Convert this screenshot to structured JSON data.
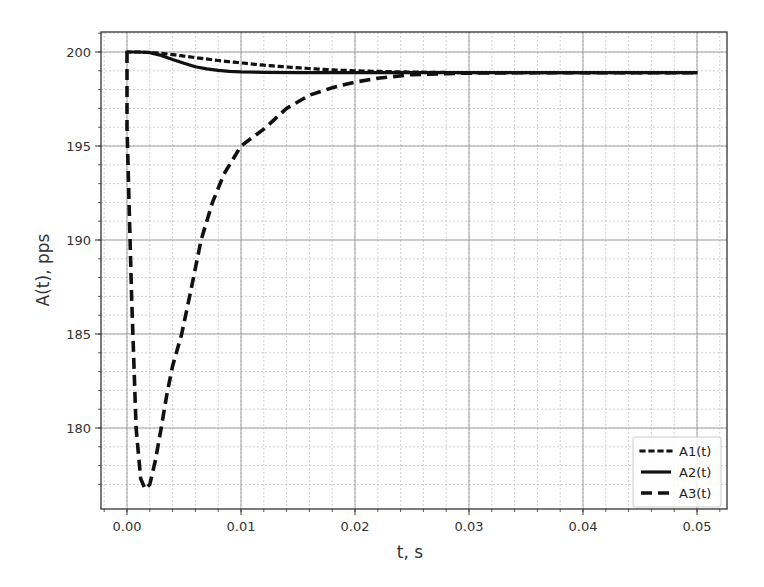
{
  "chart_data": {
    "type": "line",
    "title": "",
    "xlabel": "t, s",
    "ylabel": "A(t), pps",
    "xlim": [
      -0.0022,
      0.0528
    ],
    "ylim": [
      176.1,
      201.1
    ],
    "xticks": [
      0.0,
      0.01,
      0.02,
      0.03,
      0.04,
      0.05
    ],
    "xtick_labels": [
      "0.00",
      "0.01",
      "0.02",
      "0.03",
      "0.04",
      "0.05"
    ],
    "yticks": [
      180,
      185,
      190,
      195,
      200
    ],
    "ytick_labels": [
      "180",
      "185",
      "190",
      "195",
      "200"
    ],
    "x_minor_step": 0.002,
    "y_minor_step": 1,
    "grid": true,
    "grid_minor": true,
    "legend_position": "lower right",
    "series": [
      {
        "name": "A1(t)",
        "style": "dotted",
        "x": [
          0.0,
          0.001,
          0.002,
          0.003,
          0.004,
          0.005,
          0.006,
          0.008,
          0.01,
          0.012,
          0.014,
          0.016,
          0.018,
          0.02,
          0.022,
          0.025,
          0.03,
          0.035,
          0.04,
          0.045,
          0.05
        ],
        "y": [
          200.0,
          200.0,
          199.98,
          199.93,
          199.86,
          199.78,
          199.7,
          199.55,
          199.42,
          199.3,
          199.2,
          199.12,
          199.05,
          199.0,
          198.97,
          198.93,
          198.9,
          198.9,
          198.9,
          198.9,
          198.9
        ]
      },
      {
        "name": "A2(t)",
        "style": "solid",
        "x": [
          0.0,
          0.001,
          0.002,
          0.003,
          0.004,
          0.005,
          0.006,
          0.007,
          0.008,
          0.009,
          0.01,
          0.012,
          0.015,
          0.02,
          0.03,
          0.04,
          0.05
        ],
        "y": [
          200.0,
          200.0,
          199.97,
          199.82,
          199.6,
          199.4,
          199.22,
          199.1,
          199.02,
          198.97,
          198.94,
          198.92,
          198.9,
          198.9,
          198.9,
          198.9,
          198.9
        ]
      },
      {
        "name": "A3(t)",
        "style": "dashed",
        "x": [
          0.0,
          0.0,
          0.0004,
          0.0008,
          0.0012,
          0.0016,
          0.002,
          0.0025,
          0.003,
          0.0035,
          0.004,
          0.0048,
          0.0056,
          0.0065,
          0.0075,
          0.0085,
          0.01,
          0.012,
          0.014,
          0.016,
          0.018,
          0.02,
          0.022,
          0.025,
          0.028,
          0.03,
          0.035,
          0.04,
          0.045,
          0.05
        ],
        "y": [
          200.0,
          196.0,
          187.0,
          180.0,
          177.3,
          176.75,
          177.0,
          178.3,
          180.0,
          181.8,
          183.3,
          185.0,
          187.3,
          190.0,
          192.0,
          193.5,
          195.0,
          195.9,
          197.0,
          197.7,
          198.1,
          198.4,
          198.6,
          198.8,
          198.85,
          198.88,
          198.9,
          198.9,
          198.9,
          198.9
        ]
      }
    ]
  }
}
